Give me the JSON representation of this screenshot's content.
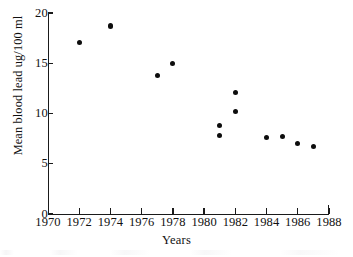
{
  "chart_data": {
    "type": "scatter",
    "title": "",
    "xlabel": "Years",
    "ylabel": "Mean blood lead ug/100 ml",
    "xlim": [
      1970,
      1988
    ],
    "ylim": [
      0,
      20
    ],
    "xticks": [
      1970,
      1972,
      1974,
      1976,
      1978,
      1980,
      1982,
      1984,
      1986,
      1988
    ],
    "xticklabels": [
      "1970",
      "1972",
      "1974",
      "1976",
      "1978",
      "1980",
      "1982",
      "1984",
      "1986",
      "1988"
    ],
    "yticks": [
      0,
      5,
      10,
      15,
      20
    ],
    "yticklabels": [
      "0",
      "5",
      "10",
      "15",
      "20"
    ],
    "grid": false,
    "legend": false,
    "marker": "filled-circle",
    "marker_color": "#0d0d0d",
    "series": [
      {
        "name": "Mean blood lead",
        "x": [
          1972,
          1974,
          1977,
          1978,
          1981,
          1981,
          1982,
          1982,
          1984,
          1985,
          1986,
          1987
        ],
        "y": [
          17.1,
          18.7,
          13.8,
          15.0,
          8.8,
          7.8,
          12.1,
          10.2,
          7.6,
          7.7,
          7.0,
          6.7
        ]
      }
    ]
  },
  "axes": {
    "y_title": "Mean blood lead ug/100 ml",
    "x_title": "Years"
  },
  "colors": {
    "ink": "#1a1a1a",
    "marker": "#0d0d0d",
    "background": "#ffffff"
  }
}
